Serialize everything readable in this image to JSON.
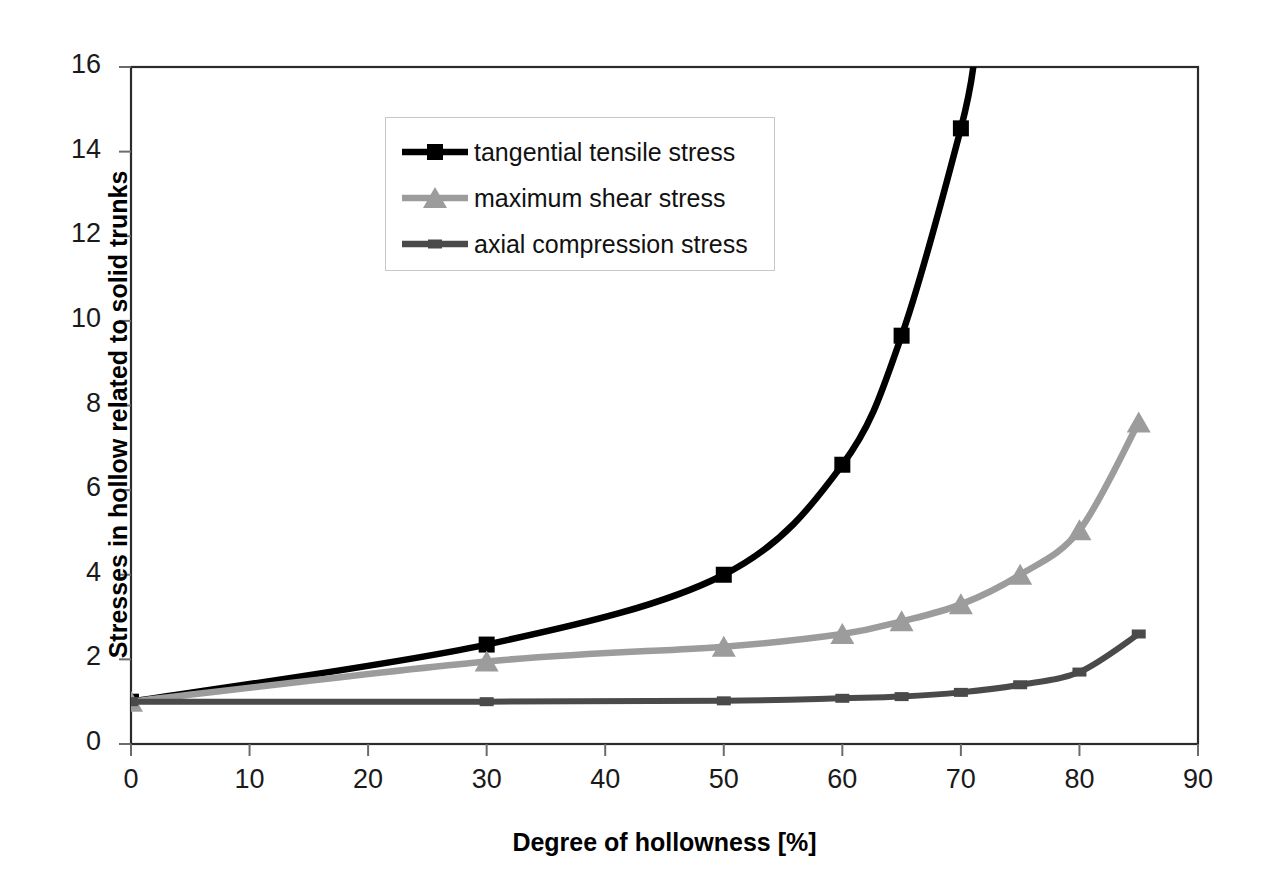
{
  "chart_data": {
    "type": "line",
    "title": "",
    "xlabel": "Degree of hollowness [%]",
    "ylabel": "Stresses in hollow related to solid trunks",
    "xlim": [
      0,
      90
    ],
    "ylim": [
      0,
      16
    ],
    "xticks": [
      0,
      10,
      20,
      30,
      40,
      50,
      60,
      70,
      80,
      90
    ],
    "yticks": [
      0,
      2,
      4,
      6,
      8,
      10,
      12,
      14,
      16
    ],
    "xtick_labels": [
      "0",
      "10",
      "20",
      "30",
      "40",
      "50",
      "60",
      "70",
      "80",
      "90"
    ],
    "ytick_labels": [
      "0",
      "2",
      "4",
      "6",
      "8",
      "10",
      "12",
      "14",
      "16"
    ],
    "grid": false,
    "legend_position": "upper-left-inside",
    "series": [
      {
        "name": "tangential tensile stress",
        "color": "#000000",
        "marker": "square",
        "x": [
          0,
          30,
          50,
          60,
          65,
          70,
          71.2
        ],
        "values": [
          1.0,
          2.35,
          4.0,
          6.6,
          9.65,
          14.55,
          16.3
        ]
      },
      {
        "name": "maximum shear stress",
        "color": "#9c9c9c",
        "marker": "triangle",
        "x": [
          0,
          30,
          50,
          60,
          65,
          70,
          75,
          80,
          85
        ],
        "values": [
          1.0,
          1.95,
          2.3,
          2.6,
          2.9,
          3.3,
          4.0,
          5.05,
          7.6
        ]
      },
      {
        "name": "axial compression stress",
        "color": "#4a4a4a",
        "marker": "dash",
        "x": [
          0,
          30,
          50,
          60,
          65,
          70,
          75,
          80,
          85
        ],
        "values": [
          1.0,
          1.0,
          1.02,
          1.08,
          1.12,
          1.22,
          1.4,
          1.7,
          2.6
        ]
      }
    ]
  },
  "legend": {
    "items": [
      {
        "label": "tangential tensile stress",
        "color": "#000000",
        "marker": "square"
      },
      {
        "label": "maximum shear stress",
        "color": "#9c9c9c",
        "marker": "triangle"
      },
      {
        "label": "axial compression stress",
        "color": "#4a4a4a",
        "marker": "dash"
      }
    ]
  },
  "axes": {
    "x_title": "Degree of hollowness [%]",
    "y_title": "Stresses in hollow related to solid trunks"
  }
}
